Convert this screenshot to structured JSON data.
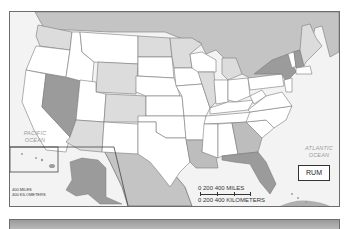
{
  "map": {
    "type": "choropleth-grayscale",
    "subject": "United States",
    "legend_code": "RUM",
    "oceans": {
      "pacific": "PACIFIC OCEAN",
      "atlantic": "ATLANTIC OCEAN"
    },
    "scale": {
      "miles_label": "0   200   400 MILES",
      "km_label": "0 200 400 KILOMETERS"
    },
    "inset_scale": {
      "miles_label": "400 MILES",
      "km_label": "400 KILOMETERS"
    },
    "shading": {
      "dark": [
        "Nevada",
        "New York",
        "New Hampshire",
        "Florida",
        "Alaska"
      ],
      "medium": [
        "Georgia",
        "Louisiana"
      ],
      "light": [
        "Washington",
        "Wyoming",
        "Colorado",
        "Arizona",
        "North Dakota",
        "Minnesota",
        "Illinois",
        "Michigan",
        "Maine"
      ],
      "none": [
        "Oregon",
        "California",
        "Idaho",
        "Montana",
        "Utah",
        "New Mexico",
        "Texas",
        "Oklahoma",
        "Kansas",
        "Nebraska",
        "South Dakota",
        "Iowa",
        "Missouri",
        "Arkansas",
        "Mississippi",
        "Alabama",
        "Tennessee",
        "Kentucky",
        "Indiana",
        "Ohio",
        "Wisconsin",
        "Pennsylvania",
        "West Virginia",
        "Virginia",
        "North Carolina",
        "South Carolina"
      ]
    },
    "colors": {
      "dark": "#9b9b9b",
      "medium": "#bdbdbd",
      "light": "#dcdcdc",
      "none": "#ffffff",
      "foreign": "#c4c4c4",
      "water": "#f3f3f3",
      "border": "#7a7a7a"
    }
  }
}
